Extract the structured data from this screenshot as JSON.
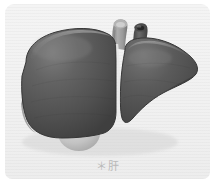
{
  "figure": {
    "caption": "＊肝",
    "organ_label": "liver",
    "panel_background": "#f1f1f1",
    "page_background": "#ffffff"
  },
  "anatomy": {
    "parts": [
      {
        "id": "right-lobe",
        "label": "right lobe",
        "color": "#4f4f4f",
        "highlight": "#747474"
      },
      {
        "id": "left-lobe",
        "label": "left lobe",
        "color": "#4c4c4c",
        "highlight": "#6e6e6e"
      },
      {
        "id": "hepatic-vein-stump",
        "label": "hepatic vein stump",
        "color": "#9a9a9a",
        "lumen": "#c9c9c9"
      },
      {
        "id": "portal-vein-stump",
        "label": "portal vein stump",
        "color": "#5b5b5b",
        "lumen": "#2e2e2e"
      },
      {
        "id": "gallbladder",
        "label": "gallbladder",
        "color": "#c6c6c6",
        "shadow": "#aaaaaa"
      }
    ]
  },
  "colors": {
    "organ_dark": "#4b4b4b",
    "organ_mid": "#5a5a5a",
    "organ_light": "#787878",
    "outline": "#3a3a3a",
    "vessel_light": "#9d9d9d",
    "vessel_dark": "#585858",
    "gallbladder": "#c8c8c8",
    "caption_text": "#b9b9b9"
  }
}
